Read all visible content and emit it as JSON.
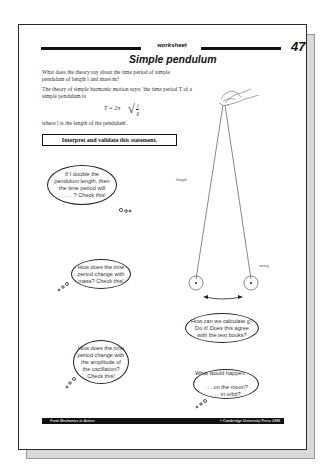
{
  "worksheet": {
    "label": "worksheet",
    "page_number": "47",
    "title": "Simple pendulum"
  },
  "intro": {
    "paragraph1": "What does the theory say about the time period of simple pendulum of length l and mass m?",
    "paragraph2": "The theory of simple harmonic motion says: 'the time period T of a simple pendulum is",
    "formula": {
      "lhs": "T = 2π",
      "numerator": "l",
      "denominator": "g"
    },
    "paragraph3": "where l is the length of the pendulum'.",
    "statement": "Interpret and validate this statement."
  },
  "diagram": {
    "length_label": "length",
    "string_label": "string"
  },
  "bubbles": [
    {
      "lines": [
        "If I double the",
        "pendulum length, then",
        "the time period will",
        ". . . . . ? Check this!"
      ]
    },
    {
      "lines": [
        "How does the time",
        "period change with",
        "mass? Check this!"
      ]
    },
    {
      "lines": [
        "How does the time",
        "period change with",
        "the amplitude of",
        "the oscillation?",
        "Check this!"
      ]
    },
    {
      "lines": [
        "How can we calculate g?",
        "Do it! Does this agree",
        "with the text books?"
      ]
    },
    {
      "lines": [
        "What would happen . . . . .",
        ". . . on the moon?",
        ". . . in orbit?"
      ]
    }
  ],
  "footer": {
    "source": "From Mechanics in Action",
    "copyright": "© Cambridge University Press 1998"
  }
}
